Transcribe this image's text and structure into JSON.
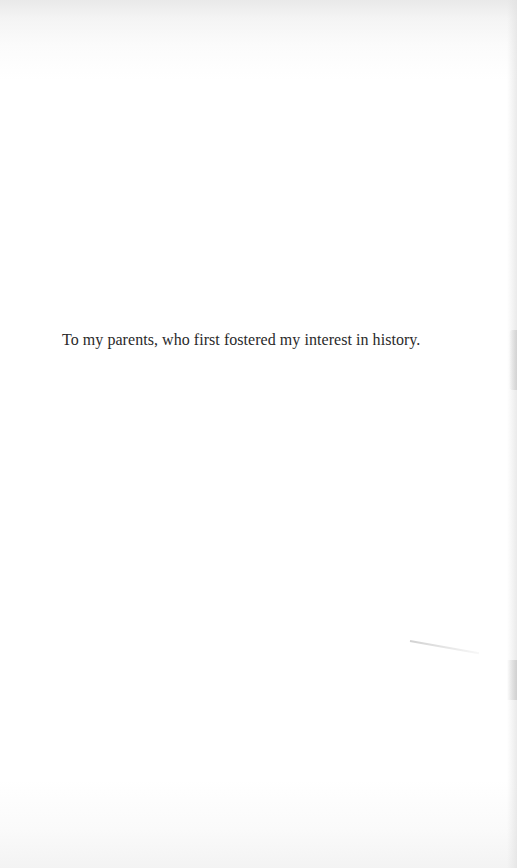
{
  "page": {
    "type": "dedication",
    "background_color": "#ffffff",
    "text_color": "#2a2a2a"
  },
  "dedication": {
    "text": "To my parents, who first fostered my interest in history."
  }
}
